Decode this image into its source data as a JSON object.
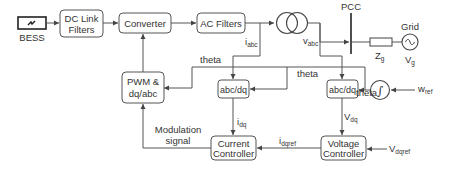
{
  "diagram": {
    "title": "",
    "blocks": {
      "bess": {
        "label": "BESS"
      },
      "dc_link": {
        "line1": "DC Link",
        "line2": "Filters"
      },
      "converter": {
        "label": "Converter"
      },
      "ac_filters": {
        "label": "AC Filters"
      },
      "pwm": {
        "line1": "PWM &",
        "line2": "dq/abc"
      },
      "abcdq_current": {
        "label": "abc/dq"
      },
      "abcdq_voltage": {
        "label": "abc/dq"
      },
      "current_ctrl": {
        "line1": "Current",
        "line2": "Controller"
      },
      "voltage_ctrl": {
        "line1": "Voltage",
        "line2": "Controller"
      },
      "integrator": {
        "symbol": "∫"
      },
      "grid": {
        "label": "Grid",
        "symbol": "~"
      },
      "pcc": {
        "label": "PCC"
      }
    },
    "signals": {
      "iabc": {
        "main": "i",
        "sub": "abc"
      },
      "vabc": {
        "main": "v",
        "sub": "abc"
      },
      "zg": {
        "main": "Z",
        "sub": "g"
      },
      "vg": {
        "main": "V",
        "sub": "g"
      },
      "theta1": "theta",
      "theta2": "theta",
      "theta3": "theta",
      "wref": {
        "main": "w",
        "sub": "ref"
      },
      "idq": {
        "main": "i",
        "sub": "dq"
      },
      "vdq": {
        "main": "V",
        "sub": "dq"
      },
      "idqref": {
        "main": "i",
        "sub": "dqref"
      },
      "vdqref": {
        "main": "V",
        "sub": "dqref"
      },
      "modulation": {
        "line1": "Modulation",
        "line2": "signal"
      }
    },
    "colors": {
      "stroke": "#555555",
      "text": "#333333",
      "background": "#ffffff"
    }
  }
}
